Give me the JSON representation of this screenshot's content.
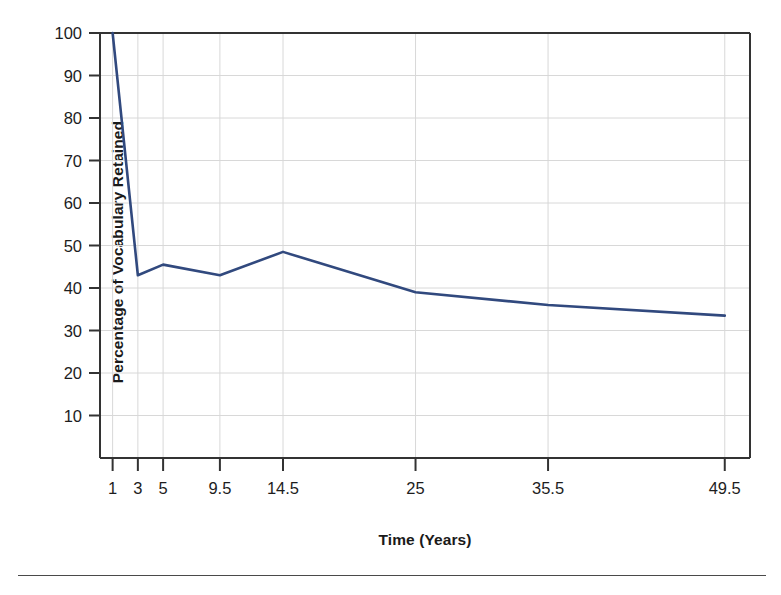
{
  "chart_data": {
    "type": "line",
    "title": "",
    "xlabel": "Time (Years)",
    "ylabel": "Percentage of Vocabulary Retained",
    "x": [
      1,
      3,
      5,
      9.5,
      14.5,
      25,
      35.5,
      49.5
    ],
    "values": [
      100,
      43,
      45.5,
      43,
      48.5,
      39,
      36,
      33.5
    ],
    "series": [
      {
        "name": "Percentage of Vocabulary Retained",
        "values": [
          100,
          43,
          45.5,
          43,
          48.5,
          39,
          36,
          33.5
        ]
      }
    ],
    "xtick_labels": [
      "1",
      "3",
      "5",
      "9.5",
      "14.5",
      "25",
      "35.5",
      "49.5"
    ],
    "xtick_values": [
      1,
      3,
      5,
      9.5,
      14.5,
      25,
      35.5,
      49.5
    ],
    "ytick_labels": [
      "10",
      "20",
      "30",
      "40",
      "50",
      "60",
      "70",
      "80",
      "90",
      "100"
    ],
    "ytick_values": [
      10,
      20,
      30,
      40,
      50,
      60,
      70,
      80,
      90,
      100
    ],
    "xlim": [
      0,
      51.5
    ],
    "ylim": [
      0,
      100
    ],
    "grid": true,
    "legend": "none",
    "line_color": "#31497e",
    "grid_color": "#d8d8d8",
    "axis_color": "#333333",
    "text_color": "#1d1d1d"
  }
}
